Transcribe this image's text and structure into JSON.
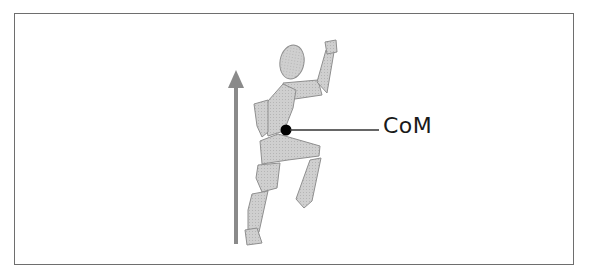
{
  "diagram": {
    "label": "CoM",
    "elements": [
      "upward-arrow",
      "running-figure",
      "center-of-mass-dot",
      "leader-line"
    ]
  },
  "colors": {
    "figure_fill": "#c8c8c8",
    "figure_stroke": "#8c8c8c",
    "arrow": "#8a8a8a",
    "dot": "#000000",
    "line": "#333333",
    "border": "#6e6e6e"
  }
}
